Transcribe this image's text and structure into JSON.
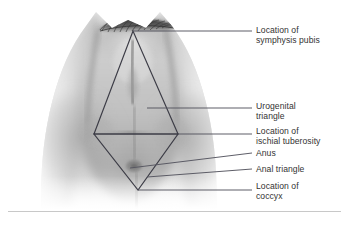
{
  "figure": {
    "caption": "",
    "width": 349,
    "height": 226,
    "background_color": "#ffffff"
  },
  "illustration": {
    "name": "female-perineum-anatomical-drawing",
    "description": "Grayscale anatomical drawing of the female perineum viewed from below, with thighs at left and right, pubic hair along the top edge, and a superimposed diamond outline formed by the urogenital triangle above and the anal triangle below.",
    "style": "grayscale-airbrush",
    "tones": {
      "highlight": "#f4f4f4",
      "light": "#dcdcdc",
      "mid": "#b4b4b4",
      "shadow": "#8d8d8d",
      "deep_shadow": "#6a6a6a",
      "hair": "#4a4a4a"
    }
  },
  "overlay": {
    "name": "perineum-diamond-overlay",
    "line_color": "#3c3c46",
    "line_width": 1.15,
    "vertices": {
      "symphysis_pubis": {
        "x": 133,
        "y": 31
      },
      "ischial_tuberosity_left": {
        "x": 94,
        "y": 134
      },
      "ischial_tuberosity_right": {
        "x": 178,
        "y": 134
      },
      "coccyx": {
        "x": 138,
        "y": 190
      }
    },
    "shapes": [
      {
        "name": "urogenital-triangle",
        "points": "133,31 94,134 178,134"
      },
      {
        "name": "anal-triangle",
        "points": "94,134 178,134 138,190"
      }
    ]
  },
  "callouts": [
    {
      "id": "symphysis-pubis",
      "label": "Location of\nsymphysis pubis",
      "label_x": 256,
      "label_y": 25,
      "leader": {
        "x1": 133,
        "y1": 31,
        "x2": 252,
        "y2": 31
      }
    },
    {
      "id": "urogenital-triangle",
      "label": "Urogenital\ntriangle",
      "label_x": 256,
      "label_y": 101,
      "leader": {
        "x1": 147,
        "y1": 108,
        "x2": 252,
        "y2": 108
      }
    },
    {
      "id": "ischial-tuberosity",
      "label": "Location of\nischial tuberosity",
      "label_x": 256,
      "label_y": 126,
      "leader": {
        "x1": 178,
        "y1": 134,
        "x2": 252,
        "y2": 134
      }
    },
    {
      "id": "anus",
      "label": "Anus",
      "label_x": 256,
      "label_y": 148,
      "leader": {
        "x1": 130,
        "y1": 168,
        "x2": 252,
        "y2": 153
      }
    },
    {
      "id": "anal-triangle",
      "label": "Anal triangle",
      "label_x": 256,
      "label_y": 164,
      "leader": {
        "x1": 147,
        "y1": 177,
        "x2": 252,
        "y2": 169
      }
    },
    {
      "id": "coccyx",
      "label": "Location of\ncoccyx",
      "label_x": 256,
      "label_y": 181,
      "leader": {
        "x1": 138,
        "y1": 190,
        "x2": 252,
        "y2": 190
      }
    }
  ],
  "leader_line_color": "#555560",
  "label_color": "#333333"
}
